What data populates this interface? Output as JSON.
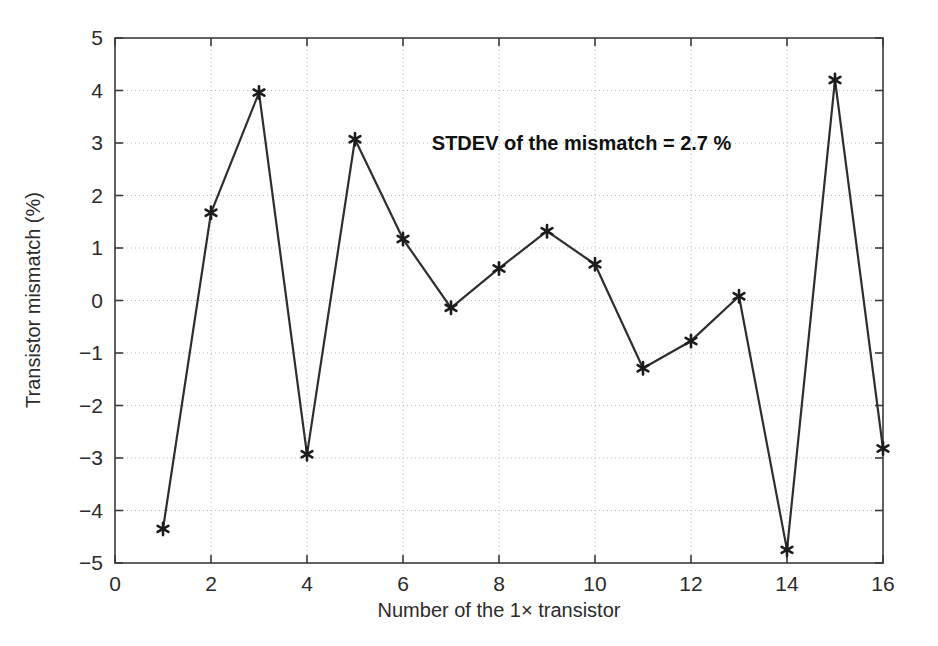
{
  "chart_data": {
    "type": "line",
    "title": "",
    "xlabel": "Number of the 1× transistor",
    "ylabel": "Transistor mismatch (%)",
    "xlim": [
      0,
      16
    ],
    "ylim": [
      -5,
      5
    ],
    "xticks": [
      0,
      2,
      4,
      6,
      8,
      10,
      12,
      14,
      16
    ],
    "yticks": [
      5,
      4,
      3,
      2,
      1,
      0,
      -1,
      -2,
      -3,
      -4,
      -5
    ],
    "xtick_labels": [
      "0",
      "2",
      "4",
      "6",
      "8",
      "10",
      "12",
      "14",
      "16"
    ],
    "ytick_labels": [
      "5",
      "4",
      "3",
      "2",
      "1",
      "0",
      "−1",
      "−2",
      "−3",
      "−4",
      "−5"
    ],
    "grid": true,
    "grid_style": "dotted",
    "legend": null,
    "marker": "asterisk",
    "line_color": "#2e2e2e",
    "marker_color": "#1c1c1c",
    "x": [
      1,
      2,
      3,
      4,
      5,
      6,
      7,
      8,
      9,
      10,
      11,
      12,
      13,
      14,
      15,
      16
    ],
    "values": [
      -4.35,
      1.67,
      3.96,
      -2.93,
      3.07,
      1.17,
      -0.14,
      0.61,
      1.32,
      0.69,
      -1.29,
      -0.77,
      0.08,
      -4.75,
      4.2,
      -2.82
    ],
    "series": [
      {
        "name": "Transistor mismatch",
        "values": [
          -4.35,
          1.67,
          3.96,
          -2.93,
          3.07,
          1.17,
          -0.14,
          0.61,
          1.32,
          0.69,
          -1.29,
          -0.77,
          0.08,
          -4.75,
          4.2,
          -2.82
        ]
      }
    ],
    "annotations": [
      {
        "name": "stdev-note",
        "text": "STDEV of the mismatch = 2.7 %",
        "x": 6.6,
        "y": 3.0
      }
    ]
  },
  "colors": {
    "background": "#ffffff",
    "axis": "#3a3a3a",
    "grid": "#b9b9b9",
    "text": "#2b2b2b",
    "data_line": "#2e2e2e"
  }
}
